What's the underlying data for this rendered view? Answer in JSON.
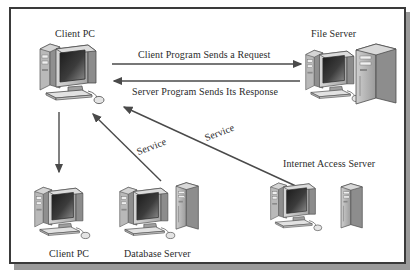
{
  "figure": {
    "kind": "network-architecture-diagram",
    "background_color": "#ffffff",
    "border_color": "#3a3a3a",
    "shadow_color": "#9a9a9a",
    "text_color": "#2b2b2b",
    "line_color": "#4a4a4a"
  },
  "nodes": [
    {
      "id": "client-pc-top",
      "label": "Client PC",
      "label_x": 44,
      "label_y": 20,
      "kind": "desktop-pc"
    },
    {
      "id": "file-server",
      "label": "File Server",
      "label_x": 300,
      "label_y": 20,
      "kind": "server-with-monitor"
    },
    {
      "id": "internet-access-server",
      "label": "Internet Access Server",
      "label_x": 272,
      "label_y": 150,
      "kind": "server-with-monitor"
    },
    {
      "id": "client-pc-bottom",
      "label": "Client PC",
      "label_x": 38,
      "label_y": 240,
      "kind": "desktop-pc"
    },
    {
      "id": "database-server",
      "label": "Database Server",
      "label_x": 113,
      "label_y": 240,
      "kind": "server-with-monitor"
    }
  ],
  "connections": [
    {
      "id": "request",
      "label": "Client Program Sends a Request",
      "label_x": 127,
      "label_y": 41,
      "direction": "client-to-file-server"
    },
    {
      "id": "response",
      "label": "Server Program Sends Its Response",
      "label_x": 121,
      "label_y": 78,
      "direction": "file-server-to-client"
    },
    {
      "id": "service-database",
      "label": "Service",
      "label_x": 128,
      "label_y": 138,
      "direction": "database-server-to-client"
    },
    {
      "id": "service-internet",
      "label": "Service",
      "label_x": 196,
      "label_y": 124,
      "direction": "internet-server-to-client"
    },
    {
      "id": "client-downlink",
      "label": "",
      "direction": "client-top-to-client-bottom"
    }
  ]
}
